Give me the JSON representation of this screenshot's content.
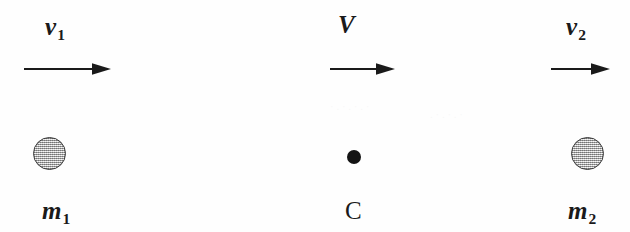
{
  "figure": {
    "background_color": "#fefefe",
    "ink_color": "#1a1a1a",
    "ball_fill_color": "#c9c9c9",
    "ball_stroke_color": "#3a3a3a",
    "point_mass_color": "#141414"
  },
  "items": [
    {
      "id": "left",
      "velocity_symbol": "v",
      "velocity_subscript": "1",
      "body_symbol": "m",
      "body_subscript": "1",
      "body_type": "sphere",
      "arrow_direction": "right"
    },
    {
      "id": "center",
      "velocity_symbol": "V",
      "velocity_subscript": "",
      "body_symbol": "C",
      "body_subscript": "",
      "body_type": "point",
      "arrow_direction": "right"
    },
    {
      "id": "right",
      "velocity_symbol": "v",
      "velocity_subscript": "2",
      "body_symbol": "m",
      "body_subscript": "2",
      "body_type": "sphere",
      "arrow_direction": "right"
    }
  ]
}
